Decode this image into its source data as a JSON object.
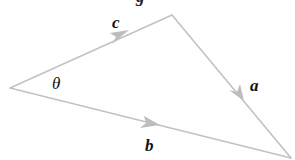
{
  "diagram": {
    "type": "vector-triangle",
    "line_color": "#c2c2c2",
    "text_color": "#111111",
    "vertices": {
      "left": [
        10,
        88
      ],
      "top": [
        172,
        15
      ],
      "bottom_right": [
        291,
        158
      ]
    },
    "vectors": [
      {
        "name": "c",
        "label": "c",
        "from": "left",
        "to": "top"
      },
      {
        "name": "a",
        "label": "a",
        "from": "top",
        "to": "bottom_right"
      },
      {
        "name": "b",
        "label": "b",
        "from": "left",
        "to": "bottom_right"
      }
    ],
    "angle_label": "θ",
    "top_cut_glyph": "g"
  }
}
